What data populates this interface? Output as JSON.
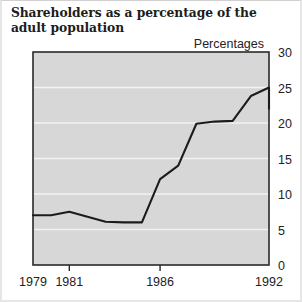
{
  "title": "Shareholders as a percentage of the adult population",
  "unit_label": "Percentages",
  "chart_data": {
    "type": "line",
    "title": "Shareholders as a percentage of the adult population",
    "xlabel": "",
    "ylabel": "Percentages",
    "ylim": [
      0,
      30
    ],
    "xlim": [
      1979,
      1992
    ],
    "yticks": [
      0,
      5,
      10,
      15,
      20,
      25,
      30
    ],
    "ytick_labels": [
      "0",
      "5",
      "10",
      "15",
      "20",
      "25",
      "30"
    ],
    "xticks": [
      1979,
      1981,
      1986,
      1992
    ],
    "xtick_labels": [
      "1979",
      "1981",
      "1986",
      "1992"
    ],
    "grid": "horizontal",
    "legend": "none",
    "plot_background": "#d7d7d7",
    "gridline_color": "#f2f2f2",
    "line_color": "#1c1c1c",
    "series": [
      {
        "name": "Shareholders",
        "x": [
          1979,
          1980,
          1981,
          1982,
          1983,
          1984,
          1985,
          1986,
          1987,
          1988,
          1989,
          1990,
          1991,
          1992
        ],
        "values": [
          7.0,
          7.0,
          7.5,
          6.8,
          6.1,
          6.0,
          6.0,
          12.1,
          14.0,
          19.9,
          20.2,
          20.3,
          23.8,
          25.0
        ]
      }
    ],
    "values_note": "final point falls to 22.0"
  }
}
